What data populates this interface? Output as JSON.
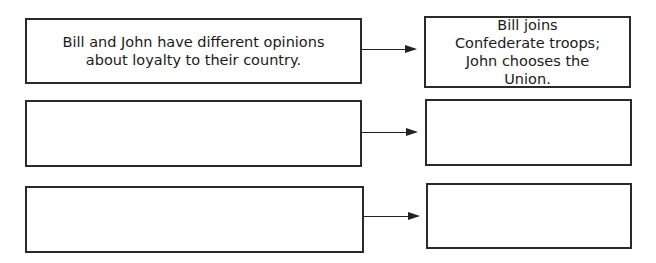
{
  "diagram": {
    "type": "cause-effect chart",
    "rows": [
      {
        "cause": "Bill and John have different opinions about loyalty to their country.",
        "effect": "Bill joins Confederate troops; John chooses the Union."
      },
      {
        "cause": "",
        "effect": ""
      },
      {
        "cause": "",
        "effect": ""
      }
    ]
  }
}
